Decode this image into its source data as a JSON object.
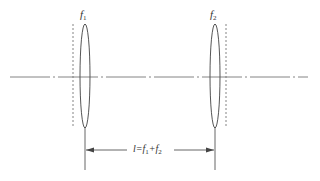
{
  "diagram": {
    "type": "optical-system",
    "lenses": [
      {
        "id": "lens-1",
        "label": "f",
        "subscript": "1",
        "focal_plane_side": "left"
      },
      {
        "id": "lens-2",
        "label": "f",
        "subscript": "2",
        "focal_plane_side": "right"
      }
    ],
    "optical_axis": {
      "style": "dash-dot"
    },
    "dimension": {
      "label": "l=f",
      "sub1": "1",
      "plus": "+f",
      "sub2": "2"
    },
    "colors": {
      "line": "#555555",
      "dashed": "#777777",
      "text": "#333333"
    }
  }
}
